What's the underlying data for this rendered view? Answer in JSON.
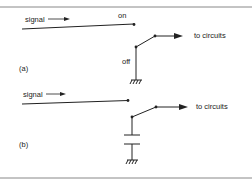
{
  "figure": {
    "panel_a": {
      "label": "(a)",
      "signal_label": "signal",
      "on_label": "on",
      "off_label": "off",
      "output_label": "to circuits"
    },
    "panel_b": {
      "label": "(b)",
      "signal_label": "signal",
      "output_label": "to circuits"
    },
    "colors": {
      "ink": "#222222",
      "border": "#888888",
      "background": "#ffffff"
    }
  }
}
